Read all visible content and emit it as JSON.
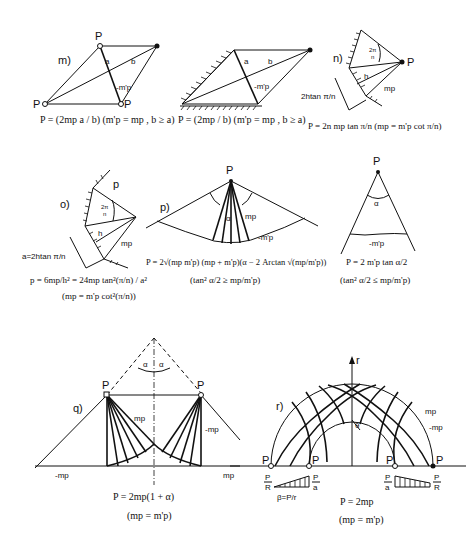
{
  "figure": {
    "panels": [
      {
        "id": "m",
        "label": "m)",
        "node": "P",
        "labels": [
          "a",
          "b",
          "-m'p"
        ],
        "formula": "P = (2mp a / b)   (m'p = mp , b ≥ a)"
      },
      {
        "id": "m2",
        "label": "",
        "node": "P",
        "labels": [
          "a",
          "b",
          "-m'p"
        ],
        "formula": "P = (2mp / b)   (m'p = mp , b ≥ a)"
      },
      {
        "id": "n",
        "label": "n)",
        "node": "P",
        "labels": [
          "2π/n",
          "h",
          "mp",
          "2h tan π/n"
        ],
        "formula": "P = 2n mp tan π/n  (mp = m'p cot π/n)"
      },
      {
        "id": "o",
        "label": "o)",
        "node": "p",
        "labels": [
          "2π/n",
          "h",
          "mp",
          "a = 2h tan π/n"
        ],
        "formula": "p = 6mp/h² = 24mp tan²(π/n) / a²",
        "condition": "(mp = m'p cot²(π/n))"
      },
      {
        "id": "p",
        "label": "p)",
        "node": "P",
        "labels": [
          "α",
          "mp",
          "-m'p"
        ],
        "formula": "P = 2√(mp m'p) (mp + m'p)(α − 2 Arctan √(mp/m'p))",
        "condition": "(tan² α/2 ≥ mp/m'p)"
      },
      {
        "id": "p2",
        "label": "",
        "node": "P",
        "labels": [
          "α",
          "-m'p"
        ],
        "formula": "P = 2 m'p tan α/2",
        "condition": "(tan² α/2 ≤ mp/m'p)"
      },
      {
        "id": "q",
        "label": "q)",
        "node": "P",
        "labels": [
          "α",
          "α",
          "mp",
          "-mp",
          "-mp",
          "mp"
        ],
        "formula": "P = 2mp(1 + α)",
        "condition": "(mp = m'p)"
      },
      {
        "id": "r",
        "label": "r)",
        "node": "P",
        "labels": [
          "r",
          "θ",
          "mp",
          "-mp",
          "P/R",
          "P/a",
          "β = P/r",
          "P/a",
          "P/R"
        ],
        "formula": "P = 2mp",
        "condition": "(mp = m'p)"
      }
    ]
  }
}
